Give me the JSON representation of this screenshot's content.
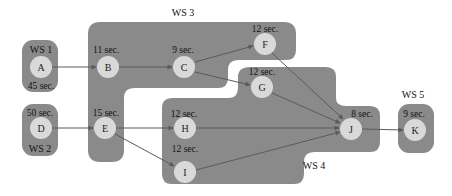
{
  "diagram": {
    "type": "workstation-assignment-precedence-graph",
    "colors": {
      "region": "#8a8a8a",
      "node": "#d9d9d9",
      "edge": "#5a5a5a",
      "background": "#ffffff"
    },
    "workstations": [
      {
        "id": "ws1",
        "label": "WS 1",
        "tasks": [
          "A"
        ]
      },
      {
        "id": "ws2",
        "label": "WS 2",
        "tasks": [
          "D"
        ]
      },
      {
        "id": "ws3",
        "label": "WS 3",
        "tasks": [
          "B",
          "C",
          "E",
          "F"
        ]
      },
      {
        "id": "ws4",
        "label": "WS 4",
        "tasks": [
          "G",
          "H",
          "I",
          "J"
        ]
      },
      {
        "id": "ws5",
        "label": "WS 5",
        "tasks": [
          "K"
        ]
      }
    ],
    "nodes": {
      "A": {
        "label": "A",
        "time": "45 sec."
      },
      "B": {
        "label": "B",
        "time": "11 sec."
      },
      "C": {
        "label": "C",
        "time": "9 sec."
      },
      "D": {
        "label": "D",
        "time": "50 sec."
      },
      "E": {
        "label": "E",
        "time": "15 sec."
      },
      "F": {
        "label": "F",
        "time": "12 sec."
      },
      "G": {
        "label": "G",
        "time": "12 sec."
      },
      "H": {
        "label": "H",
        "time": "12 sec."
      },
      "I": {
        "label": "I",
        "time": "12 sec."
      },
      "J": {
        "label": "J",
        "time": "8 sec."
      },
      "K": {
        "label": "K",
        "time": "9 sec."
      }
    },
    "edges": [
      {
        "from": "A",
        "to": "B"
      },
      {
        "from": "B",
        "to": "C"
      },
      {
        "from": "C",
        "to": "F"
      },
      {
        "from": "C",
        "to": "G"
      },
      {
        "from": "D",
        "to": "E"
      },
      {
        "from": "E",
        "to": "H"
      },
      {
        "from": "E",
        "to": "I"
      },
      {
        "from": "F",
        "to": "J"
      },
      {
        "from": "G",
        "to": "J"
      },
      {
        "from": "H",
        "to": "J"
      },
      {
        "from": "I",
        "to": "J"
      },
      {
        "from": "J",
        "to": "K"
      }
    ]
  }
}
